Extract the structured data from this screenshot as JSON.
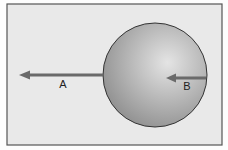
{
  "figure": {
    "frame": {
      "x": 7,
      "y": 4,
      "width": 215,
      "height": 141,
      "fill": "#e9e9e9",
      "stroke": "#555555"
    },
    "sphere": {
      "cx": 155,
      "cy": 75,
      "r": 52,
      "light": "#e6e6e6",
      "dark": "#8e8e8e",
      "stroke": "#333333"
    },
    "arrows": [
      {
        "id": "A",
        "label": "A",
        "x1": 103,
        "y1": 75,
        "x2": 19,
        "y2": 75,
        "label_x": 63,
        "label_y": 88,
        "color": "#6a6a6a"
      },
      {
        "id": "B",
        "label": "B",
        "x1": 206,
        "y1": 78,
        "x2": 166,
        "y2": 78,
        "label_x": 187,
        "label_y": 90,
        "color": "#6a6a6a"
      }
    ]
  }
}
